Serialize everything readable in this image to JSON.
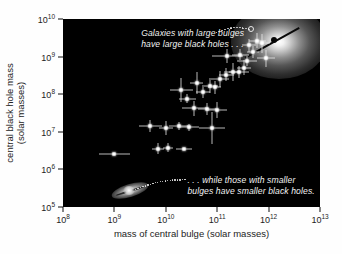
{
  "chart_data": {
    "type": "scatter",
    "title": "",
    "xlabel": "mass of central bulge (solar masses)",
    "ylabel_line1": "central black hole mass",
    "ylabel_line2": "(solar masses)",
    "xscale": "log",
    "yscale": "log",
    "xlim": [
      100000000.0,
      10000000000000.0
    ],
    "ylim": [
      100000.0,
      10000000000.0
    ],
    "xticks": [
      "10⁸",
      "10⁹",
      "10¹⁰",
      "10¹¹",
      "10¹²",
      "10¹³"
    ],
    "xtick_exponents": [
      "8",
      "9",
      "10",
      "11",
      "12",
      "13"
    ],
    "ytick_exponents": [
      "5",
      "6",
      "7",
      "8",
      "9",
      "10"
    ],
    "grid": false,
    "legend": "none",
    "background": "#000000",
    "marker_color": "#ffffff",
    "errorbar_color": "#ebebeb",
    "fitline_color": "#0a0a0a",
    "points": [
      {
        "x": 9.0,
        "y": 6.4,
        "xerr_lo": 0.3,
        "xerr_hi": 0.3,
        "yerr_lo": 0.0,
        "yerr_hi": 0.0
      },
      {
        "x": 9.85,
        "y": 6.55,
        "xerr_lo": 0.12,
        "xerr_hi": 0.12,
        "yerr_lo": 0.14,
        "yerr_hi": 0.14
      },
      {
        "x": 10.05,
        "y": 6.58,
        "xerr_lo": 0.1,
        "xerr_hi": 0.1,
        "yerr_lo": 0.12,
        "yerr_hi": 0.12
      },
      {
        "x": 10.35,
        "y": 6.53,
        "xerr_lo": 0.16,
        "xerr_hi": 0.16,
        "yerr_lo": 0.0,
        "yerr_hi": 0.0
      },
      {
        "x": 9.7,
        "y": 7.15,
        "xerr_lo": 0.22,
        "xerr_hi": 0.22,
        "yerr_lo": 0.16,
        "yerr_hi": 0.16
      },
      {
        "x": 10.0,
        "y": 7.1,
        "xerr_lo": 0.14,
        "xerr_hi": 0.14,
        "yerr_lo": 0.18,
        "yerr_hi": 0.18
      },
      {
        "x": 10.25,
        "y": 7.15,
        "xerr_lo": 0.18,
        "xerr_hi": 0.18,
        "yerr_lo": 0.1,
        "yerr_hi": 0.1
      },
      {
        "x": 10.45,
        "y": 7.12,
        "xerr_lo": 0.2,
        "xerr_hi": 0.2,
        "yerr_lo": 0.1,
        "yerr_hi": 0.1
      },
      {
        "x": 10.9,
        "y": 7.1,
        "xerr_lo": 0.26,
        "xerr_hi": 0.26,
        "yerr_lo": 0.42,
        "yerr_hi": 0.42
      },
      {
        "x": 10.55,
        "y": 7.62,
        "xerr_lo": 0.24,
        "xerr_hi": 0.24,
        "yerr_lo": 0.2,
        "yerr_hi": 0.2
      },
      {
        "x": 10.8,
        "y": 7.6,
        "xerr_lo": 0.18,
        "xerr_hi": 0.18,
        "yerr_lo": 0.16,
        "yerr_hi": 0.16
      },
      {
        "x": 11.0,
        "y": 7.58,
        "xerr_lo": 0.2,
        "xerr_hi": 0.2,
        "yerr_lo": 0.22,
        "yerr_hi": 0.22
      },
      {
        "x": 10.42,
        "y": 7.88,
        "xerr_lo": 0.16,
        "xerr_hi": 0.16,
        "yerr_lo": 0.12,
        "yerr_hi": 0.12
      },
      {
        "x": 10.72,
        "y": 8.05,
        "xerr_lo": 0.14,
        "xerr_hi": 0.14,
        "yerr_lo": 0.14,
        "yerr_hi": 0.14
      },
      {
        "x": 10.6,
        "y": 8.3,
        "xerr_lo": 0.12,
        "xerr_hi": 0.12,
        "yerr_lo": 0.3,
        "yerr_hi": 0.3
      },
      {
        "x": 10.3,
        "y": 8.12,
        "xerr_lo": 0.22,
        "xerr_hi": 0.22,
        "yerr_lo": 0.32,
        "yerr_hi": 0.32
      },
      {
        "x": 10.86,
        "y": 8.22,
        "xerr_lo": 0.16,
        "xerr_hi": 0.16,
        "yerr_lo": 0.2,
        "yerr_hi": 0.2
      },
      {
        "x": 10.95,
        "y": 8.18,
        "xerr_lo": 0.12,
        "xerr_hi": 0.12,
        "yerr_lo": 0.18,
        "yerr_hi": 0.18
      },
      {
        "x": 11.05,
        "y": 8.4,
        "xerr_lo": 0.18,
        "xerr_hi": 0.18,
        "yerr_lo": 0.22,
        "yerr_hi": 0.22
      },
      {
        "x": 11.18,
        "y": 8.52,
        "xerr_lo": 0.14,
        "xerr_hi": 0.14,
        "yerr_lo": 0.18,
        "yerr_hi": 0.18
      },
      {
        "x": 11.3,
        "y": 8.6,
        "xerr_lo": 0.16,
        "xerr_hi": 0.16,
        "yerr_lo": 0.24,
        "yerr_hi": 0.24
      },
      {
        "x": 11.42,
        "y": 8.58,
        "xerr_lo": 0.2,
        "xerr_hi": 0.2,
        "yerr_lo": 0.16,
        "yerr_hi": 0.16
      },
      {
        "x": 11.52,
        "y": 8.7,
        "xerr_lo": 0.14,
        "xerr_hi": 0.14,
        "yerr_lo": 0.2,
        "yerr_hi": 0.2
      },
      {
        "x": 11.2,
        "y": 9.02,
        "xerr_lo": 0.3,
        "xerr_hi": 0.3,
        "yerr_lo": 0.18,
        "yerr_hi": 0.18
      },
      {
        "x": 11.45,
        "y": 9.05,
        "xerr_lo": 0.16,
        "xerr_hi": 0.16,
        "yerr_lo": 0.14,
        "yerr_hi": 0.14
      },
      {
        "x": 11.62,
        "y": 9.3,
        "xerr_lo": 0.14,
        "xerr_hi": 0.14,
        "yerr_lo": 0.18,
        "yerr_hi": 0.18
      },
      {
        "x": 11.7,
        "y": 9.12,
        "xerr_lo": 0.12,
        "xerr_hi": 0.12,
        "yerr_lo": 0.16,
        "yerr_hi": 0.16
      },
      {
        "x": 11.78,
        "y": 9.42,
        "xerr_lo": 0.16,
        "xerr_hi": 0.16,
        "yerr_lo": 0.2,
        "yerr_hi": 0.2
      },
      {
        "x": 11.88,
        "y": 9.35,
        "xerr_lo": 0.14,
        "xerr_hi": 0.14,
        "yerr_lo": 0.26,
        "yerr_hi": 0.26
      },
      {
        "x": 11.95,
        "y": 8.95,
        "xerr_lo": 0.18,
        "xerr_hi": 0.18,
        "yerr_lo": 0.22,
        "yerr_hi": 0.22
      },
      {
        "x": 11.58,
        "y": 8.88,
        "xerr_lo": 0.2,
        "xerr_hi": 0.2,
        "yerr_lo": 0.14,
        "yerr_hi": 0.14
      }
    ],
    "fit_line": {
      "x0": 11.55,
      "y0": 9.0,
      "x1": 12.6,
      "y1": 9.8
    },
    "highlight_marker": {
      "x": 11.66,
      "y": 9.74,
      "style": "open-circle"
    },
    "annotations": [
      {
        "name": "large-bulges-note",
        "line1": "Galaxies with large bulges",
        "line2": "have large black holes . . .",
        "x": 9.52,
        "y": 9.64
      },
      {
        "name": "smaller-bulges-note",
        "line1": ". . . while those with smaller",
        "line2": "bulges have smaller black holes.",
        "x": 10.42,
        "y": 5.72
      }
    ],
    "inset_images": [
      {
        "name": "elliptical-galaxy",
        "x": 12.2,
        "y": 9.38,
        "description": "elliptical galaxy glow with central black hole"
      },
      {
        "name": "spiral-galaxy",
        "x": 9.3,
        "y": 5.45,
        "description": "edge-on spiral galaxy"
      }
    ]
  },
  "caption": {
    "text": ""
  }
}
